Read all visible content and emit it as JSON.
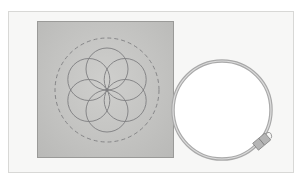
{
  "scene": {
    "description": "Embroidery fabric square with seed-of-life pattern and an empty embroidery hoop",
    "colors": {
      "background": "#ffffff",
      "frame": "#f7f7f6",
      "fabric": "#c6c6c4",
      "pattern_stroke": "#7e7e80",
      "hoop_outer": "#a9a9a9",
      "hoop_inner": "#dcdcdc"
    },
    "pattern": {
      "cx": 107,
      "cy": 90,
      "petal_radius": 21,
      "dashed_radius": 52
    },
    "hoop": {
      "cx": 222,
      "cy": 110,
      "radius": 49
    }
  }
}
